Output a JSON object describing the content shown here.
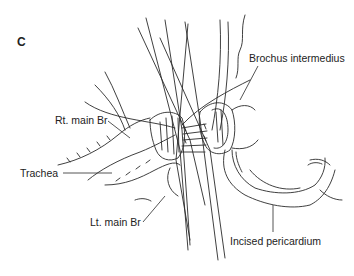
{
  "figure": {
    "panel_letter": "C",
    "labels": {
      "rt_main_br": "Rt. main Br",
      "brochus_intermedius": "Brochus intermedius",
      "trachea": "Trachea",
      "lt_main_br": "Lt. main Br",
      "incised_pericardium": "Incised pericardium"
    },
    "colors": {
      "line": "#2a2a2a",
      "background": "#ffffff",
      "text": "#222222"
    }
  }
}
